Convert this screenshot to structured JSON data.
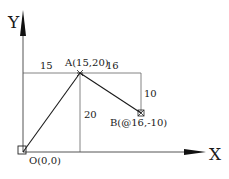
{
  "axes": {
    "x_label": "X",
    "y_label": "Y"
  },
  "points": {
    "origin": {
      "label": "O(0,0)"
    },
    "A": {
      "label": "A(15,20)"
    },
    "B": {
      "label": "B(@16,-10)"
    }
  },
  "dimensions": {
    "horizontal_left": "15",
    "horizontal_right": "16",
    "vertical_A": "20",
    "vertical_B": "10"
  },
  "colors": {
    "line": "#1a1a1a",
    "guide": "#555555",
    "background": "#ffffff"
  }
}
